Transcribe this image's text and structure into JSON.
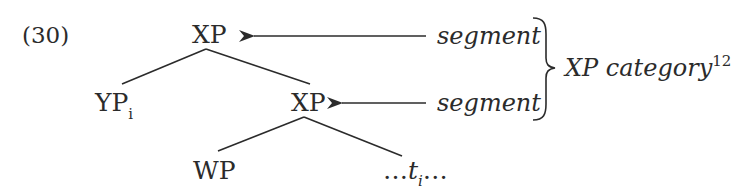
{
  "example": {
    "number": "(30)"
  },
  "tree": {
    "root": {
      "label": "XP"
    },
    "left_child": {
      "label": "YP",
      "subscript": "i"
    },
    "right_child": {
      "label": "XP"
    },
    "grandchild_left": {
      "label": "WP"
    },
    "grandchild_right": {
      "prefix": "…",
      "label": "t",
      "subscript": "i",
      "suffix": "…"
    }
  },
  "annotations": {
    "top_arrow_label": "segment",
    "middle_arrow_label": "segment",
    "brace_label": "XP category",
    "brace_label_footnote": "12"
  },
  "colors": {
    "ink": "#2b2b2b",
    "background": "#ffffff"
  }
}
